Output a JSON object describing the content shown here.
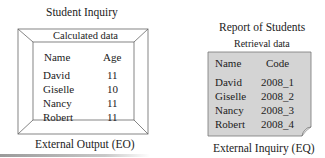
{
  "left_panel": {
    "title": "Student Inquiry",
    "header": "Calculated data",
    "columns": [
      "Name",
      "Age"
    ],
    "rows": [
      {
        "name": "David",
        "value": "11"
      },
      {
        "name": "Giselle",
        "value": "10"
      },
      {
        "name": "Nancy",
        "value": "11"
      },
      {
        "name": "Robert",
        "value": "11"
      }
    ],
    "caption": "External Output (EO)"
  },
  "right_panel": {
    "title": "Report of Students",
    "header": "Retrieval data",
    "columns": [
      "Name",
      "Code"
    ],
    "rows": [
      {
        "name": "David",
        "value": "2008_1"
      },
      {
        "name": "Giselle",
        "value": "2008_2"
      },
      {
        "name": "Nancy",
        "value": "2008_3"
      },
      {
        "name": "Robert",
        "value": "2008_4"
      }
    ],
    "caption": "External Inquiry (EQ)"
  },
  "colors": {
    "frame_line": "#555555",
    "sheet_fill": "#d4d4d4",
    "text": "#222222"
  }
}
